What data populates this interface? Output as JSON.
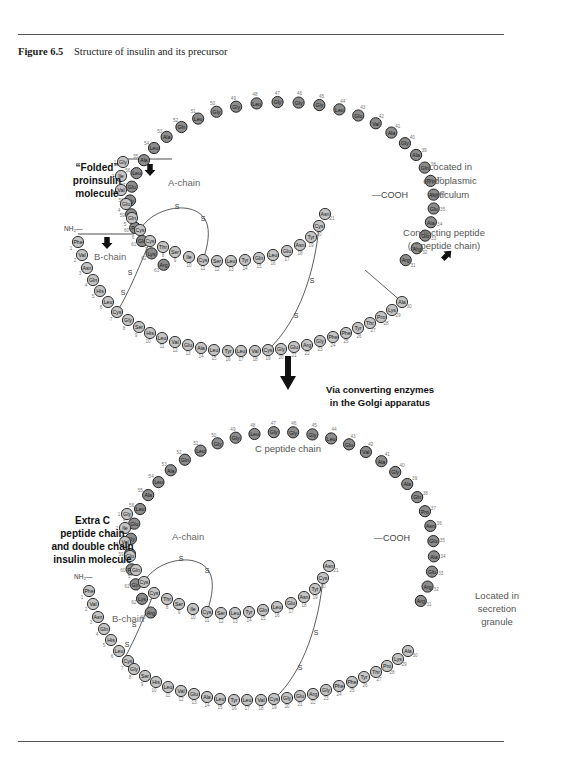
{
  "figure": {
    "number": "Figure 6.5",
    "title": "Structure of insulin and its precursor"
  },
  "top_diagram": {
    "title_lines": [
      "“Folded”",
      "proinsulin",
      "molecule"
    ],
    "a_chain_label": "A-chain",
    "b_chain_label": "B-chain",
    "nh2_label": "NH₂—",
    "cooh_label": "—COOH",
    "location_lines": [
      "Located in",
      "endoplasmic",
      "reticulum"
    ],
    "connecting_lines": [
      "Connecting peptide",
      "(C peptide chain)"
    ],
    "disulfide_label": "S"
  },
  "transition": {
    "lines": [
      "Via converting enzymes",
      "in the Golgi apparatus"
    ],
    "icon": "down-arrow-icon"
  },
  "bottom_diagram": {
    "title_lines": [
      "Extra C",
      "peptide chain",
      "and double chain",
      "insulin molecule"
    ],
    "c_peptide_label": "C peptide chain",
    "a_chain_label": "A-chain",
    "b_chain_label": "B-chain",
    "nh2_label": "NH₂—",
    "cooh_label": "—COOH",
    "location_lines": [
      "Located in",
      "secretion",
      "granule"
    ]
  },
  "sequences": {
    "a_chain": [
      "Gly",
      "Ile",
      "Val",
      "Glu",
      "Gln",
      "Cys",
      "Cys",
      "Thr",
      "Ser",
      "Ile",
      "Cys",
      "Ser",
      "Leu",
      "Tyr",
      "Gln",
      "Leu",
      "Glu",
      "Asn",
      "Tyr",
      "Cys",
      "Asn"
    ],
    "b_chain": [
      "Phe",
      "Val",
      "Asn",
      "Gln",
      "His",
      "Leu",
      "Cys",
      "Gly",
      "Ser",
      "His",
      "Leu",
      "Val",
      "Glu",
      "Ala",
      "Leu",
      "Tyr",
      "Leu",
      "Val",
      "Cys",
      "Gly",
      "Glu",
      "Arg",
      "Gly",
      "Phe",
      "Phe",
      "Tyr",
      "Thr",
      "Pro",
      "Lys",
      "Ala"
    ],
    "c_peptide": {
      "start_number": 31,
      "residues": [
        "Arg",
        "Arg",
        "Glu",
        "Ala",
        "Glu",
        "Asn",
        "Pro",
        "Gln",
        "Ala",
        "Gly",
        "Ala",
        "Val",
        "Glu",
        "Leu",
        "Gly",
        "Gly",
        "Gly",
        "Leu",
        "Gly",
        "Gly",
        "Leu",
        "Gln",
        "Ala",
        "Leu",
        "Ala",
        "Leu",
        "Glu",
        "Gly",
        "Pro",
        "Pro",
        "Gln",
        "Lys",
        "Arg"
      ]
    }
  },
  "colors": {
    "c_peptide_bead": "#8c8c8c",
    "insulin_bead": "#c4c4c4",
    "rule": "#555555"
  }
}
